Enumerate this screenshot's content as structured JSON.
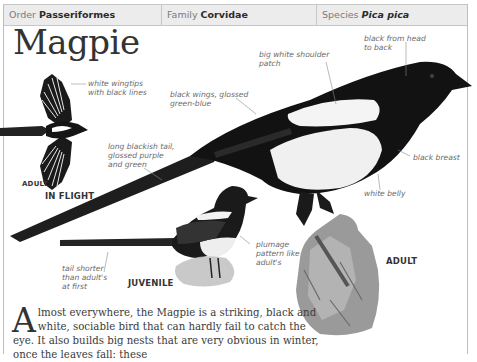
{
  "taxonomy": {
    "order_label": "Order",
    "order_value": "Passeriformes",
    "family_label": "Family",
    "family_value": "Corvidae",
    "species_label": "Species",
    "species_value": "Pica pica"
  },
  "title": "Magpie",
  "annotations": {
    "wingtips": [
      "white wingtips",
      "with black lines"
    ],
    "shoulder": [
      "big white shoulder",
      "patch"
    ],
    "head": [
      "black from head",
      "to back"
    ],
    "wings": [
      "black wings, glossed",
      "green-blue"
    ],
    "tail": [
      "long blackish tail,",
      "glossed purple",
      "and green"
    ],
    "breast": [
      "black breast"
    ],
    "belly": [
      "white belly"
    ],
    "plumage": [
      "plumage",
      "pattern like",
      "adult's"
    ],
    "tail_short": [
      "tail shorter",
      "than adult's",
      "at first"
    ]
  },
  "captions": {
    "flight_adult": "ADULT",
    "in_flight": "IN FLIGHT",
    "juvenile": "JUVENILE",
    "adult": "ADULT"
  },
  "body": {
    "dropcap": "A",
    "text": "lmost everywhere, the Magpie is a striking, black and white, sociable bird that can hardly fail to catch the eye. It also builds big nests that are very obvious in winter, once the leaves fall: these"
  }
}
